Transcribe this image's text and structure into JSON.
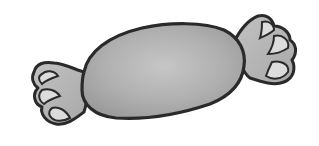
{
  "image": {
    "subject": "wrapped candy",
    "style": "grayscale clip-art",
    "colors": {
      "background": "#ffffff",
      "outline": "#2a2a2a",
      "body_fill": "#a9a9a9",
      "body_highlight": "#c4c4c4",
      "wrapper_fill": "#b8b8b8",
      "wrapper_light": "#dcdcdc"
    }
  }
}
